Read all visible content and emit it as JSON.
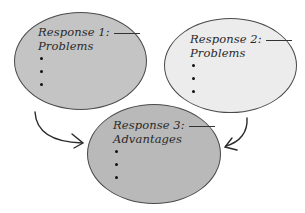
{
  "diagram": {
    "nodes": [
      {
        "id": "response-1",
        "title": "Response 1:",
        "subtitle": "Problems",
        "bullets": 3,
        "fill": "#c4c4c4"
      },
      {
        "id": "response-2",
        "title": "Response 2:",
        "subtitle": "Problems",
        "bullets": 3,
        "fill": "#ececec"
      },
      {
        "id": "response-3",
        "title": "Response 3:",
        "subtitle": "Advantages",
        "bullets": 3,
        "fill": "#b9b9b9"
      }
    ],
    "edges": [
      {
        "from": "response-1",
        "to": "response-3"
      },
      {
        "from": "response-2",
        "to": "response-3"
      }
    ],
    "stroke": "#4a4a4a"
  }
}
